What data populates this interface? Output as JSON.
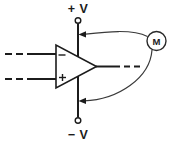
{
  "diagram": {
    "background_color": "#ffffff",
    "line_color": "#1c1c1c"
  },
  "rails": {
    "positive": {
      "label": "+ V",
      "terminal_icon": "terminal-circle",
      "polarity": "+"
    },
    "negative": {
      "label": "− V",
      "terminal_icon": "terminal-circle",
      "polarity": "−"
    }
  },
  "opamp": {
    "symbol": "triangle",
    "inverting_input_label": "−",
    "noninverting_input_label": "+",
    "inputs": [
      {
        "name": "inverting-input",
        "label": "−"
      },
      {
        "name": "noninverting-input",
        "label": "+"
      }
    ],
    "output_name": "output"
  },
  "meter": {
    "label": "M",
    "symbol": "circle",
    "name": "current-meter"
  },
  "connections": [
    {
      "name": "positive-supply-probe",
      "from": "meter",
      "to": "positive-rail",
      "arrow": "left"
    },
    {
      "name": "negative-supply-probe",
      "from": "meter",
      "to": "negative-rail",
      "arrow": "left"
    }
  ]
}
